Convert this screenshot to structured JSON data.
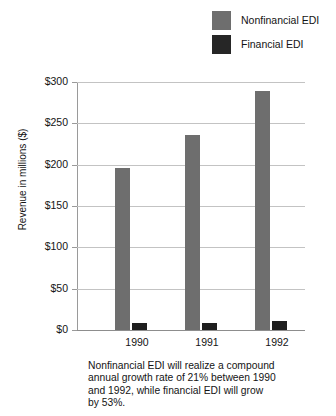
{
  "chart_data": {
    "type": "bar",
    "title": "",
    "subtitle": "",
    "xlabel": "",
    "ylabel": "Revenue in millions ($)",
    "categories": [
      "1990",
      "1991",
      "1992"
    ],
    "series": [
      {
        "name": "Nonfinancial EDI",
        "color": "#6e6e6e",
        "values": [
          196,
          236,
          289
        ]
      },
      {
        "name": "Financial EDI",
        "color": "#1f1f1f",
        "values": [
          8,
          9,
          11
        ]
      }
    ],
    "ylim": [
      0,
      300
    ],
    "ytick_values": [
      0,
      50,
      100,
      150,
      200,
      250,
      300
    ],
    "ytick_labels": [
      "$0",
      "$50",
      "$100",
      "$150",
      "$200",
      "$250",
      "$300"
    ],
    "grid": "horizontal",
    "legend_position": "top-right",
    "annotation": "Nonfinancial EDI will realize a compound annual growth rate of 21% between 1990 and 1992, while financial EDI will grow by 53%."
  },
  "legend": {
    "items": [
      {
        "label": "Nonfinancial EDI",
        "color": "#6e6e6e"
      },
      {
        "label": "Financial EDI",
        "color": "#1f1f1f"
      }
    ]
  },
  "axes": {
    "y_title": "Revenue in millions ($)",
    "y_labels": [
      "$300",
      "$250",
      "$200",
      "$150",
      "$100",
      "$50",
      "$0"
    ],
    "x_labels": [
      "1990",
      "1991",
      "1992"
    ]
  },
  "caption": {
    "lines": [
      "Nonfinancial EDI will realize a compound",
      "annual growth rate of 21% between 1990",
      "and 1992, while financial EDI will grow",
      "by 53%."
    ]
  }
}
